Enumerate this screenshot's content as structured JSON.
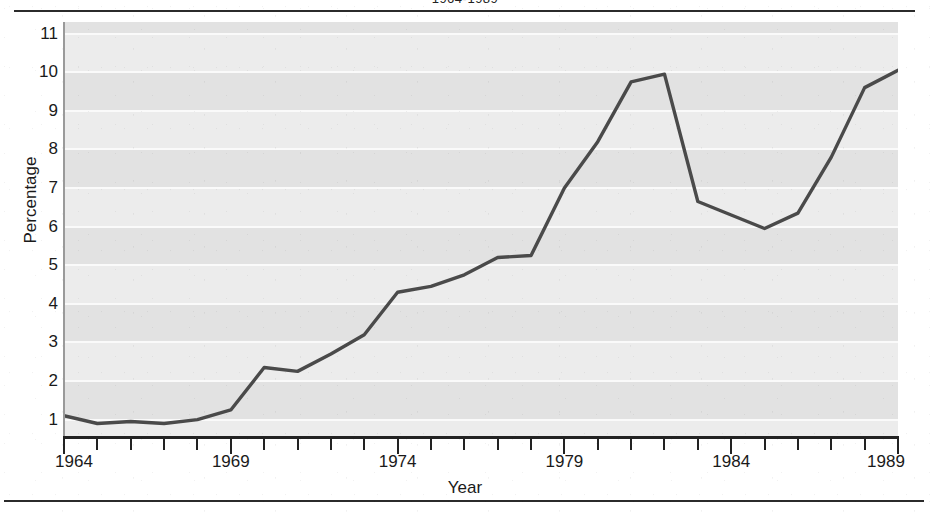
{
  "caption": "1964-1989",
  "axis": {
    "y_title": "Percentage",
    "x_title": "Year"
  },
  "chart_data": {
    "type": "line",
    "title": "1964-1989",
    "xlabel": "Year",
    "ylabel": "Percentage",
    "xlim": [
      1964,
      1989
    ],
    "ylim": [
      0.55,
      11.3
    ],
    "grid": true,
    "legend": "none",
    "line_color": "#4a4a4a",
    "plot_bg": "#e2e2e2",
    "grid_color": "#fafafa",
    "x_tick_labels": [
      "1964",
      "1969",
      "1974",
      "1979",
      "1984",
      "1989"
    ],
    "x_tick_label_years": [
      1964,
      1969,
      1974,
      1979,
      1984,
      1989
    ],
    "x_minor_tick_years": [
      1964,
      1965,
      1966,
      1967,
      1968,
      1969,
      1970,
      1971,
      1972,
      1973,
      1974,
      1975,
      1976,
      1977,
      1978,
      1979,
      1980,
      1981,
      1982,
      1983,
      1984,
      1985,
      1986,
      1987,
      1988,
      1989
    ],
    "y_tick_labels": [
      "1",
      "2",
      "3",
      "4",
      "5",
      "6",
      "7",
      "8",
      "9",
      "10",
      "11"
    ],
    "y_tick_values": [
      1,
      2,
      3,
      4,
      5,
      6,
      7,
      8,
      9,
      10,
      11
    ],
    "x": [
      1964,
      1965,
      1966,
      1967,
      1968,
      1969,
      1970,
      1971,
      1972,
      1973,
      1974,
      1975,
      1976,
      1977,
      1978,
      1979,
      1980,
      1981,
      1982,
      1983,
      1984,
      1985,
      1986,
      1987,
      1988,
      1989
    ],
    "values": [
      1.1,
      0.9,
      0.95,
      0.9,
      1.0,
      1.25,
      2.35,
      2.25,
      2.7,
      3.2,
      4.3,
      4.45,
      4.75,
      5.2,
      5.25,
      7.0,
      8.2,
      9.75,
      9.95,
      6.65,
      6.3,
      5.95,
      6.35,
      7.8,
      9.6,
      10.05
    ],
    "series": [
      {
        "name": "Percentage",
        "values": [
          1.1,
          0.9,
          0.95,
          0.9,
          1.0,
          1.25,
          2.35,
          2.25,
          2.7,
          3.2,
          4.3,
          4.45,
          4.75,
          5.2,
          5.25,
          7.0,
          8.2,
          9.75,
          9.95,
          6.65,
          6.3,
          5.95,
          6.35,
          7.8,
          9.6,
          10.05
        ]
      }
    ]
  }
}
